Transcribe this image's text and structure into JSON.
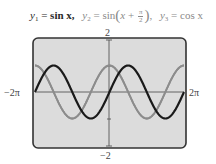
{
  "title": {
    "y1_lhs": "y",
    "y1_sub": "1",
    "y1_rhs": "sin x,",
    "y2_lhs": "y",
    "y2_sub": "2",
    "y2_fn": "sin",
    "y2_arg_var": "x",
    "y2_arg_op": "+",
    "y2_frac_num": "π",
    "y2_frac_den": "2",
    "y3_lhs": "y",
    "y3_sub": "3",
    "y3_rhs": "cos x",
    "equals": "="
  },
  "axis_labels": {
    "ymax": "2",
    "ymin": "−2",
    "xmin": "−2π",
    "xmax": "2π"
  },
  "colors": {
    "frame_bg": "#dcdcdc",
    "frame_border": "#333333",
    "axis": "#555555",
    "y1_curve": "#1a1a1a",
    "y2_y3_curve": "#8c8c8c"
  },
  "chart_data": {
    "type": "line",
    "xlabel": "",
    "ylabel": "",
    "xlim": [
      -6.2832,
      6.2832
    ],
    "ylim": [
      -2,
      2
    ],
    "x_tick_labels": [
      "−2π",
      "2π"
    ],
    "y_tick_labels": [
      "−2",
      "2"
    ],
    "y_ticks": [
      -2,
      -1,
      0,
      1,
      2
    ],
    "grid": false,
    "legend": "none (equations shown in title, color-matched to curves)",
    "series": [
      {
        "name": "y1 = sin x",
        "color": "#1a1a1a",
        "function": "sin(x)",
        "x": [
          -6.2832,
          -4.7124,
          -3.1416,
          -1.5708,
          0,
          1.5708,
          3.1416,
          4.7124,
          6.2832
        ],
        "values": [
          0,
          1,
          0,
          -1,
          0,
          1,
          0,
          -1,
          0
        ]
      },
      {
        "name": "y2 = sin(x + π/2)",
        "color": "#8c8c8c",
        "function": "sin(x+pi/2)",
        "x": [
          -6.2832,
          -4.7124,
          -3.1416,
          -1.5708,
          0,
          1.5708,
          3.1416,
          4.7124,
          6.2832
        ],
        "values": [
          1,
          0,
          -1,
          0,
          1,
          0,
          -1,
          0,
          1
        ]
      },
      {
        "name": "y3 = cos x",
        "color": "#8c8c8c",
        "function": "cos(x)",
        "x": [
          -6.2832,
          -4.7124,
          -3.1416,
          -1.5708,
          0,
          1.5708,
          3.1416,
          4.7124,
          6.2832
        ],
        "values": [
          1,
          0,
          -1,
          0,
          1,
          0,
          -1,
          0,
          1
        ]
      }
    ],
    "note": "y2 and y3 are identical and drawn as one overlapping gray curve"
  }
}
